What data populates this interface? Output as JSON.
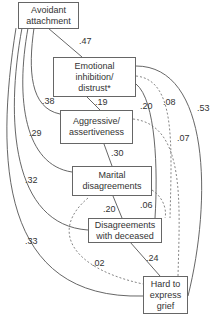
{
  "nodes": {
    "avoidant": "Avoidant\nattachment",
    "emotional": "Emotional\ninhibition/\ndistrust*",
    "aggressive": "Aggressive/\nassertiveness",
    "marital": "Marital\ndisagreements",
    "disagreements": "Disagreements\nwith deceased",
    "grief": "Hard to\nexpress\ngrief"
  },
  "edges": {
    "avoidant_emotional": ".47",
    "avoidant_aggressive": ".38",
    "avoidant_marital": ".29",
    "avoidant_disagreements": ".32",
    "avoidant_grief": ".33",
    "emotional_aggressive": ".19",
    "emotional_disagreements": ".20",
    "emotional_grief_solid": ".53",
    "emotional_dashed_08": ".08",
    "aggressive_dashed_07": ".07",
    "aggressive_marital": ".30",
    "marital_disagreements": ".20",
    "marital_dashed_06": ".06",
    "disagreements_grief": ".24",
    "dashed_02": ".02"
  }
}
